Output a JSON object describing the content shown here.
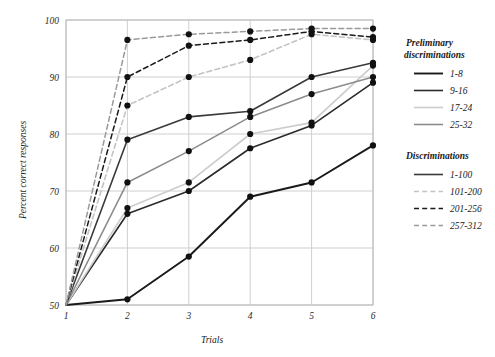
{
  "chart_data": {
    "type": "line",
    "title": "",
    "xlabel": "Trials",
    "ylabel": "Percent correct responses",
    "x": [
      1,
      2,
      3,
      4,
      5,
      6
    ],
    "xticklabels": [
      "1",
      "2",
      "3",
      "4",
      "5",
      "6"
    ],
    "yticklabels": [
      "50",
      "60",
      "70",
      "80",
      "90",
      "100"
    ],
    "yticks": [
      50,
      60,
      70,
      80,
      90,
      100
    ],
    "xlim": [
      1,
      6
    ],
    "ylim": [
      50,
      100
    ],
    "grid": true,
    "legend_position": "right",
    "markers": "filled-circle",
    "series": [
      {
        "name": "1-8",
        "group": "Preliminary discriminations",
        "values": [
          50,
          51,
          58.5,
          69,
          71.5,
          78
        ],
        "color": "#1a1a1a",
        "dash": "solid",
        "width": 1.9
      },
      {
        "name": "9-16",
        "group": "Preliminary discriminations",
        "values": [
          50,
          66,
          70,
          77.5,
          81.5,
          89
        ],
        "color": "#2b2b2b",
        "dash": "solid",
        "width": 1.6
      },
      {
        "name": "17-24",
        "group": "Preliminary discriminations",
        "values": [
          50,
          67,
          71.5,
          80,
          82,
          92
        ],
        "color": "#cccccc",
        "dash": "solid",
        "width": 1.6
      },
      {
        "name": "25-32",
        "group": "Preliminary discriminations",
        "values": [
          50,
          71.5,
          77,
          83,
          87,
          90
        ],
        "color": "#8c8c8c",
        "dash": "solid",
        "width": 1.6
      },
      {
        "name": "1-100",
        "group": "Discriminations",
        "values": [
          50,
          79,
          83,
          84,
          90,
          92.5
        ],
        "color": "#3a3a3a",
        "dash": "solid",
        "width": 1.6
      },
      {
        "name": "101-200",
        "group": "Discriminations",
        "values": [
          50,
          85,
          90,
          93,
          97.5,
          96.5
        ],
        "color": "#c4c4c4",
        "dash": "dashed",
        "width": 1.6
      },
      {
        "name": "201-256",
        "group": "Discriminations",
        "values": [
          50,
          90,
          95.5,
          96.5,
          98,
          97
        ],
        "color": "#1a1a1a",
        "dash": "dashed",
        "width": 1.5
      },
      {
        "name": "257-312",
        "group": "Discriminations",
        "values": [
          50,
          96.5,
          97.5,
          98,
          98.5,
          98.5
        ],
        "color": "#9a9a9a",
        "dash": "dashed",
        "width": 1.5
      }
    ]
  },
  "legend": {
    "groups": [
      {
        "heading": "Preliminary",
        "heading2": "discriminations",
        "entries": [
          "1-8",
          "9-16",
          "17-24",
          "25-32"
        ]
      },
      {
        "heading": "Discriminations",
        "heading2": "",
        "entries": [
          "1-100",
          "101-200",
          "201-256",
          "257-312"
        ]
      }
    ]
  },
  "colors": {
    "grid": "#cfcfcf",
    "frame": "#b9b9b9",
    "marker": "#111111",
    "background": "#ffffff"
  }
}
